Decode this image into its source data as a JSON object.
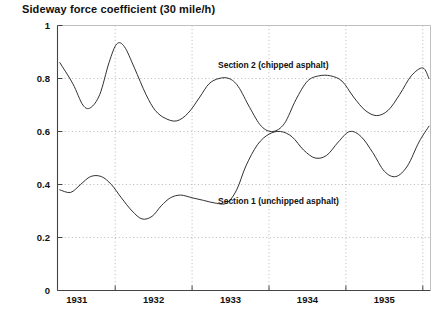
{
  "chart_data": {
    "type": "line",
    "title": "Sideway force coefficient (30 mile/h)",
    "xlabel": "",
    "ylabel": "",
    "xlim": [
      1930.75,
      1935.6
    ],
    "ylim": [
      0,
      1
    ],
    "grid": true,
    "grid_style": "dotted",
    "legend": "inline-annotations",
    "xticks": [
      1931,
      1932,
      1933,
      1934,
      1935
    ],
    "xtick_labels": [
      "1931",
      "1932",
      "1933",
      "1934",
      "1935"
    ],
    "yticks": [
      0,
      0.2,
      0.4,
      0.6,
      0.8,
      1
    ],
    "ytick_labels": [
      "0",
      "0.2",
      "0.4",
      "0.6",
      "0.8",
      "1"
    ],
    "series": [
      {
        "name": "Section 2 (chipped asphalt)",
        "color": "#1a1a1a",
        "annotation": "Section 2 (chipped asphalt)",
        "x": [
          1930.78,
          1930.95,
          1931.08,
          1931.18,
          1931.3,
          1931.42,
          1931.52,
          1931.62,
          1931.75,
          1931.9,
          1932.02,
          1932.15,
          1932.3,
          1932.45,
          1932.6,
          1932.72,
          1932.85,
          1932.98,
          1933.1,
          1933.25,
          1933.4,
          1933.55,
          1933.7,
          1933.85,
          1934.0,
          1934.15,
          1934.3,
          1934.45,
          1934.6,
          1934.75,
          1934.9,
          1935.05,
          1935.2,
          1935.35,
          1935.5,
          1935.58
        ],
        "y": [
          0.86,
          0.78,
          0.7,
          0.69,
          0.74,
          0.86,
          0.93,
          0.92,
          0.84,
          0.74,
          0.68,
          0.65,
          0.64,
          0.67,
          0.73,
          0.78,
          0.8,
          0.8,
          0.77,
          0.69,
          0.62,
          0.6,
          0.63,
          0.72,
          0.79,
          0.81,
          0.81,
          0.79,
          0.73,
          0.68,
          0.66,
          0.68,
          0.74,
          0.81,
          0.84,
          0.8
        ]
      },
      {
        "name": "Section 1 (unchipped asphalt)",
        "color": "#1a1a1a",
        "annotation": "Section 1 (unchipped asphalt)",
        "x": [
          1930.78,
          1930.92,
          1931.05,
          1931.18,
          1931.32,
          1931.45,
          1931.58,
          1931.72,
          1931.85,
          1931.98,
          1932.1,
          1932.22,
          1932.35,
          1932.5,
          1932.65,
          1932.8,
          1932.95,
          1933.08,
          1933.2,
          1933.35,
          1933.5,
          1933.65,
          1933.8,
          1933.95,
          1934.1,
          1934.25,
          1934.4,
          1934.55,
          1934.7,
          1934.85,
          1935.0,
          1935.15,
          1935.3,
          1935.45,
          1935.58
        ],
        "y": [
          0.38,
          0.37,
          0.4,
          0.43,
          0.43,
          0.4,
          0.35,
          0.3,
          0.27,
          0.28,
          0.32,
          0.35,
          0.36,
          0.35,
          0.34,
          0.33,
          0.33,
          0.38,
          0.47,
          0.55,
          0.59,
          0.6,
          0.58,
          0.53,
          0.5,
          0.51,
          0.56,
          0.6,
          0.58,
          0.52,
          0.45,
          0.43,
          0.47,
          0.56,
          0.62
        ]
      }
    ]
  },
  "annotations": {
    "section2": "Section 2 (chipped asphalt)",
    "section1": "Section 1 (unchipped asphalt)"
  }
}
